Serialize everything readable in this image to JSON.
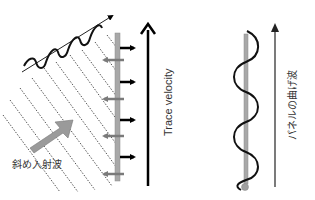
{
  "diagram": {
    "left_panel": {
      "incident_wave_label": "斜め入射波",
      "trace_velocity_label": "Trace velocity",
      "panel_arrows_right_count": 4,
      "panel_arrows_left_count": 5
    },
    "right_panel": {
      "bending_wave_label": "パネルの曲げ波"
    },
    "colors": {
      "wave": "#111111",
      "panel": "#a8a8a8",
      "arrow_black": "#000000",
      "arrow_gray": "#8a8a8a",
      "wavefront": "#555555",
      "big_arrow": "#9a9a9a",
      "text": "#333333"
    }
  }
}
